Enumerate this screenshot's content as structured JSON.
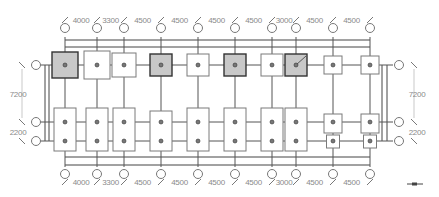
{
  "drawing": {
    "type": "foundation-plan",
    "colors": {
      "line": "#555555",
      "shaded_footing": "#c8c8c8",
      "dim_text": "#8a8a8a"
    },
    "columns_x": [
      65,
      97,
      124,
      161,
      198,
      235,
      272,
      296,
      333,
      370
    ],
    "top_dimensions": [
      "4000",
      "3300",
      "4500",
      "4500",
      "4500",
      "4500",
      "3000",
      "4500",
      "4500"
    ],
    "bottom_dimensions": [
      "4000",
      "3300",
      "4500",
      "4500",
      "4500",
      "4500",
      "3000",
      "4500",
      "4500"
    ],
    "rows_y": [
      65,
      122,
      141
    ],
    "left_dimensions": [
      "7200",
      "2200"
    ],
    "right_dimensions": [
      "7200",
      "2200"
    ],
    "top_footings": [
      {
        "col": 0,
        "w": 26,
        "h": 26,
        "shaded": true
      },
      {
        "col": 1,
        "w": 26,
        "h": 28,
        "shaded": false
      },
      {
        "col": 2,
        "w": 24,
        "h": 24,
        "shaded": false
      },
      {
        "col": 3,
        "w": 22,
        "h": 22,
        "shaded": true
      },
      {
        "col": 4,
        "w": 22,
        "h": 22,
        "shaded": false
      },
      {
        "col": 5,
        "w": 22,
        "h": 22,
        "shaded": true
      },
      {
        "col": 6,
        "w": 22,
        "h": 22,
        "shaded": false
      },
      {
        "col": 7,
        "w": 22,
        "h": 22,
        "shaded": true
      },
      {
        "col": 8,
        "w": 18,
        "h": 18,
        "shaded": false
      },
      {
        "col": 9,
        "w": 18,
        "h": 18,
        "shaded": false
      }
    ],
    "bottom_footings": [
      {
        "col": 0,
        "y1": 108,
        "y2": 151
      },
      {
        "col": 1,
        "y1": 108,
        "y2": 151
      },
      {
        "col": 2,
        "y1": 108,
        "y2": 151
      },
      {
        "col": 3,
        "y1": 111,
        "y2": 151
      },
      {
        "col": 4,
        "y1": 108,
        "y2": 151
      },
      {
        "col": 5,
        "y1": 108,
        "y2": 151
      },
      {
        "col": 6,
        "y1": 108,
        "y2": 151
      },
      {
        "col": 7,
        "y1": 108,
        "y2": 151
      }
    ],
    "small_footings": [
      {
        "col": 8,
        "y1": 114,
        "y2": 133
      },
      {
        "col": 8,
        "y1": 135,
        "y2": 148
      },
      {
        "col": 9,
        "y1": 114,
        "y2": 133
      },
      {
        "col": 9,
        "y1": 135,
        "y2": 148
      }
    ]
  }
}
